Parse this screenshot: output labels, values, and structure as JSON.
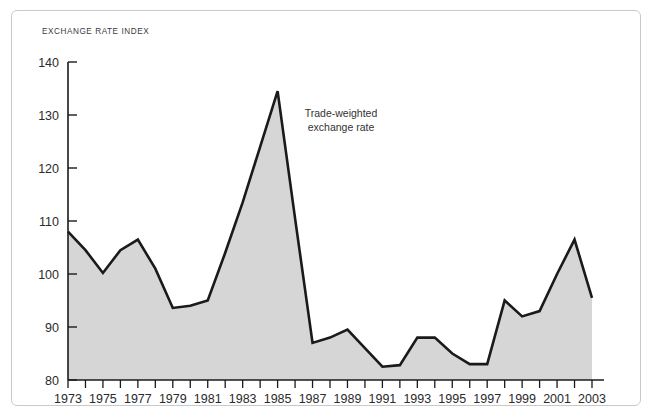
{
  "chart_data": {
    "type": "area",
    "title": "EXCHANGE RATE INDEX",
    "xlabel": "",
    "ylabel": "",
    "ylim": [
      80,
      140
    ],
    "xlim": [
      1973,
      2003
    ],
    "grid": false,
    "legend_position": "none",
    "annotations": [
      {
        "name": "series-label",
        "line1": "Trade-weighted",
        "line2": "exchange rate"
      }
    ],
    "y_ticks": [
      80,
      90,
      100,
      110,
      120,
      130,
      140
    ],
    "y_tick_labels": [
      "80",
      "90",
      "100",
      "110",
      "120",
      "130",
      "140"
    ],
    "x_ticks": [
      1973,
      1974,
      1975,
      1976,
      1977,
      1978,
      1979,
      1980,
      1981,
      1982,
      1983,
      1984,
      1985,
      1986,
      1987,
      1988,
      1989,
      1990,
      1991,
      1992,
      1993,
      1994,
      1995,
      1996,
      1997,
      1998,
      1999,
      2000,
      2001,
      2002,
      2003
    ],
    "x_tick_labels": [
      "1973",
      "1975",
      "1977",
      "1979",
      "1981",
      "1983",
      "1985",
      "1987",
      "1989",
      "1991",
      "1993",
      "1995",
      "1997",
      "1999",
      "2001",
      "2003"
    ],
    "x_tick_label_years": [
      1973,
      1975,
      1977,
      1979,
      1981,
      1983,
      1985,
      1987,
      1989,
      1991,
      1993,
      1995,
      1997,
      1999,
      2001,
      2003
    ],
    "series": [
      {
        "name": "Trade-weighted exchange rate",
        "x": [
          1973,
          1974,
          1975,
          1976,
          1977,
          1978,
          1979,
          1980,
          1981,
          1982,
          1983,
          1984,
          1985,
          1986,
          1987,
          1988,
          1989,
          1990,
          1991,
          1992,
          1993,
          1994,
          1995,
          1996,
          1997,
          1998,
          1999,
          2000,
          2001,
          2002,
          2003
        ],
        "values": [
          108.0,
          104.5,
          100.2,
          104.5,
          106.5,
          101.0,
          93.6,
          94.0,
          95.0,
          104.0,
          113.5,
          124.0,
          134.5,
          110.5,
          87.0,
          88.0,
          89.5,
          86.0,
          82.5,
          82.8,
          88.0,
          88.0,
          85.0,
          83.0,
          83.0,
          95.0,
          92.0,
          93.0,
          100.0,
          106.5,
          95.5
        ],
        "line_color": "#1a1a1a",
        "fill_color": "#d6d6d6"
      }
    ],
    "colors": {
      "line": "#1a1a1a",
      "fill": "#d6d6d6",
      "axis": "#1a1a1a",
      "text": "#2b2b2b",
      "frame": "#c9c9c9",
      "background": "#ffffff"
    }
  }
}
